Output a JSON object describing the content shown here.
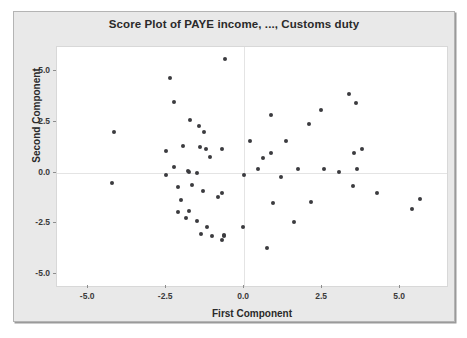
{
  "chart_data": {
    "type": "scatter",
    "title": "Score Plot of PAYE income, ..., Customs duty",
    "xlabel": "First Component",
    "ylabel": "Second Component",
    "xlim": [
      -6.0,
      6.5
    ],
    "ylim": [
      -5.6,
      6.2
    ],
    "xticks": [
      -5.0,
      -2.5,
      0.0,
      2.5,
      5.0
    ],
    "xticklabels": [
      "-5.0",
      "-2.5",
      "0.0",
      "2.5",
      "5.0"
    ],
    "yticks": [
      5.0,
      2.5,
      0.0,
      -2.5,
      -5.0
    ],
    "yticklabels": [
      "5.0",
      "2.5",
      "0.0",
      "-2.5",
      "-5.0"
    ],
    "grid": false,
    "reference_lines": {
      "x": 0.0,
      "y": 0.0
    },
    "legend": null,
    "marker": {
      "shape": "circle",
      "color": "#3b3b3f",
      "size": 4
    },
    "series": [
      {
        "name": "scores",
        "points": [
          [
            -0.62,
            5.62
          ],
          [
            -2.38,
            4.67
          ],
          [
            -2.24,
            3.48
          ],
          [
            -1.73,
            2.62
          ],
          [
            -4.18,
            1.98
          ],
          [
            -1.45,
            2.3
          ],
          [
            -1.28,
            1.98
          ],
          [
            -2.52,
            1.07
          ],
          [
            -1.97,
            1.31
          ],
          [
            -1.42,
            1.28
          ],
          [
            -1.22,
            1.14
          ],
          [
            -0.72,
            1.15
          ],
          [
            -1.1,
            0.76
          ],
          [
            -2.26,
            0.28
          ],
          [
            -1.79,
            0.1
          ],
          [
            -1.78,
            0.04
          ],
          [
            -1.52,
            0.0
          ],
          [
            -2.52,
            -0.14
          ],
          [
            -4.25,
            -0.52
          ],
          [
            -1.68,
            -0.62
          ],
          [
            -2.12,
            -0.69
          ],
          [
            -1.32,
            -0.9
          ],
          [
            -0.7,
            -1.0
          ],
          [
            -0.84,
            -1.23
          ],
          [
            -2.04,
            -1.33
          ],
          [
            -2.13,
            -1.93
          ],
          [
            -1.77,
            -1.92
          ],
          [
            -1.86,
            -2.24
          ],
          [
            -1.5,
            -2.4
          ],
          [
            -1.19,
            -2.67
          ],
          [
            -0.05,
            -2.7
          ],
          [
            -1.4,
            -3.02
          ],
          [
            -1.04,
            -3.12
          ],
          [
            -0.65,
            -3.06
          ],
          [
            -0.64,
            -3.14
          ],
          [
            -0.7,
            -3.33
          ],
          [
            0.18,
            1.57
          ],
          [
            0.86,
            2.85
          ],
          [
            1.35,
            1.55
          ],
          [
            2.08,
            2.38
          ],
          [
            2.45,
            3.1
          ],
          [
            3.37,
            3.87
          ],
          [
            3.58,
            3.45
          ],
          [
            3.78,
            1.18
          ],
          [
            3.52,
            0.95
          ],
          [
            0.6,
            0.72
          ],
          [
            0.85,
            0.98
          ],
          [
            0.45,
            0.17
          ],
          [
            1.72,
            0.2
          ],
          [
            2.55,
            0.18
          ],
          [
            3.05,
            0.02
          ],
          [
            3.6,
            0.19
          ],
          [
            -0.02,
            -0.1
          ],
          [
            1.18,
            -0.22
          ],
          [
            0.93,
            -1.48
          ],
          [
            2.15,
            -1.47
          ],
          [
            3.48,
            -0.66
          ],
          [
            4.25,
            -1.02
          ],
          [
            1.6,
            -2.44
          ],
          [
            0.72,
            -3.72
          ],
          [
            5.62,
            -1.32
          ],
          [
            5.38,
            -1.78
          ]
        ]
      }
    ]
  }
}
